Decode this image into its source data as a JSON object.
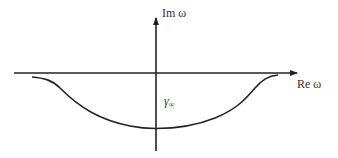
{
  "diagram": {
    "axes": {
      "vertical": {
        "label": "Im ω"
      },
      "horizontal": {
        "label": "Re ω"
      }
    },
    "contour": {
      "label_symbol": "γ",
      "label_subscript": "∞",
      "shape": "downward-bowed contour below real axis"
    },
    "colors": {
      "stroke": "#222222",
      "text": "#333333",
      "background": "#ffffff"
    }
  }
}
